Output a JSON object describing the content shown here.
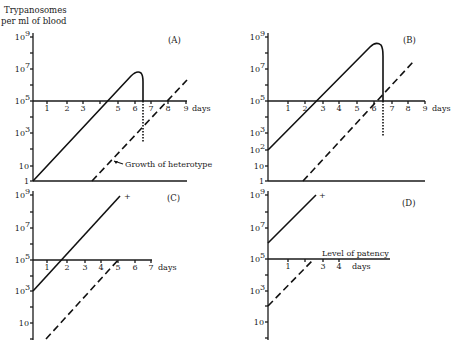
{
  "figure": {
    "ylabel_line1": "Trypanosomes",
    "ylabel_line2": "per ml of blood",
    "days_label": "days",
    "heterotype_note": "Growth of heterotype",
    "patency_note": "Level of patency",
    "colors": {
      "ink": "#111111",
      "background": "#ffffff"
    }
  },
  "chart_data": [
    {
      "type": "line",
      "panel": "(A)",
      "yscale": "log",
      "ylabel": "Trypanosomes per ml of blood",
      "xlabel": "days",
      "yticks": [
        "1",
        "10",
        "10^3",
        "10^5",
        "10^7",
        "10^9"
      ],
      "xticks": [
        1,
        2,
        3,
        4,
        5,
        6,
        7,
        8,
        9
      ],
      "ylim": [
        1,
        1000000000.0
      ],
      "xlim": [
        0,
        9
      ],
      "series": [
        {
          "name": "Infecting trypanosomes",
          "style": "solid",
          "points": [
            [
              0,
              1
            ],
            [
              5.8,
              5000000.0
            ],
            [
              6.3,
              5000000.0
            ],
            [
              6.5,
              100000.0
            ]
          ],
          "note": "falls below level of patency at ~6.5 days (dotted continuation to ~10^2.5)"
        },
        {
          "name": "Growth of heterotype",
          "style": "dashed",
          "points": [
            [
              3.5,
              1
            ],
            [
              9,
              1500000.0
            ]
          ]
        }
      ],
      "annotations": [
        "Growth of heterotype"
      ]
    },
    {
      "type": "line",
      "panel": "(B)",
      "yscale": "log",
      "xlabel": "days",
      "yticks": [
        "1",
        "10",
        "10^2",
        "10^3",
        "10^5",
        "10^7",
        "10^9"
      ],
      "xticks": [
        1,
        2,
        3,
        4,
        5,
        6,
        7,
        8,
        9
      ],
      "ylim": [
        1,
        1000000000.0
      ],
      "xlim": [
        0,
        9
      ],
      "series": [
        {
          "name": "Infecting trypanosomes",
          "style": "solid",
          "points": [
            [
              0,
              100
            ],
            [
              5.6,
              500000000.0
            ],
            [
              6.0,
              500000000.0
            ],
            [
              6.1,
              100000.0
            ]
          ],
          "note": "falls below level of patency at ~6.1 days (dotted continuation)"
        },
        {
          "name": "Heterotype",
          "style": "dashed",
          "points": [
            [
              1.9,
              1
            ],
            [
              8.3,
              20000000.0
            ]
          ]
        }
      ]
    },
    {
      "type": "line",
      "panel": "(C)",
      "yscale": "log",
      "xlabel": "days",
      "yticks": [
        "10",
        "10^3",
        "10^5",
        "10^7",
        "10^9"
      ],
      "xticks": [
        1,
        2,
        3,
        4,
        5,
        6,
        7
      ],
      "xlim": [
        0,
        7
      ],
      "series": [
        {
          "name": "Infecting trypanosomes",
          "style": "solid",
          "points": [
            [
              0,
              1000
            ],
            [
              5.2,
              1000000000.0
            ]
          ],
          "end_marker": "+ (death)"
        },
        {
          "name": "Heterotype",
          "style": "dashed",
          "points": [
            [
              0.8,
              1
            ],
            [
              5.2,
              100000.0
            ]
          ]
        }
      ]
    },
    {
      "type": "line",
      "panel": "(D)",
      "yscale": "log",
      "xlabel": "days",
      "yticks": [
        "10",
        "10^3",
        "10^5",
        "10^7",
        "10^9"
      ],
      "xticks": [
        1,
        2,
        3,
        4
      ],
      "xlim": [
        0,
        4
      ],
      "series": [
        {
          "name": "Infecting trypanosomes",
          "style": "solid",
          "points": [
            [
              0,
              1000000.0
            ],
            [
              2.6,
              1000000000.0
            ]
          ],
          "end_marker": "+ (death)"
        },
        {
          "name": "Heterotype",
          "style": "dashed",
          "points": [
            [
              0,
              100
            ],
            [
              2.5,
              100000.0
            ]
          ]
        }
      ],
      "annotations": [
        "Level of patency"
      ]
    }
  ],
  "panels": [
    {
      "id": "A",
      "label": "(A)",
      "axis_x": 33,
      "y_top": 33,
      "y_base": 181,
      "x_end": 187,
      "y_patency": 101,
      "ylabels": [
        {
          "t": "10",
          "sup": "9",
          "y": 37
        },
        {
          "t": "10",
          "sup": "7",
          "y": 69
        },
        {
          "t": "10",
          "sup": "5",
          "y": 101
        },
        {
          "t": "10",
          "sup": "3",
          "y": 133
        },
        {
          "t": "10",
          "sup": "",
          "y": 166
        },
        {
          "t": "1",
          "sup": "",
          "y": 181
        }
      ],
      "minor_ticks": [
        53,
        85,
        117,
        149
      ],
      "xticks": [
        {
          "t": "1",
          "x": 47
        },
        {
          "t": "2",
          "x": 67
        },
        {
          "t": "3",
          "x": 83
        },
        {
          "t": "",
          "x": 100
        },
        {
          "t": "5",
          "x": 118
        },
        {
          "t": "6",
          "x": 135
        },
        {
          "t": "7",
          "x": 151
        },
        {
          "t": "8",
          "x": 168
        },
        {
          "t": "9",
          "x": 186
        }
      ],
      "days_x": 192,
      "label_x": 168,
      "label_y": 43,
      "solid_path": "M33,181 L131,76 Q137,70 141,73 Q143,75 143,82 L143,101",
      "dotted_path": "M143,101 L143,143",
      "dashed_path": "M92,181 L187,80",
      "base_line": true,
      "note": {
        "x": 125,
        "y": 167,
        "arrow_from": [
          123,
          164
        ],
        "arrow_to": [
          114,
          161
        ]
      }
    },
    {
      "id": "B",
      "label": "(B)",
      "axis_x": 268,
      "y_top": 33,
      "y_base": 181,
      "x_end": 425,
      "y_patency": 101,
      "ylabels": [
        {
          "t": "10",
          "sup": "9",
          "y": 37
        },
        {
          "t": "10",
          "sup": "7",
          "y": 69
        },
        {
          "t": "10",
          "sup": "5",
          "y": 101
        },
        {
          "t": "10",
          "sup": "3",
          "y": 133
        },
        {
          "t": "10",
          "sup": "2",
          "y": 150
        },
        {
          "t": "10",
          "sup": "",
          "y": 166
        },
        {
          "t": "1",
          "sup": "",
          "y": 181
        }
      ],
      "minor_ticks": [
        53,
        85,
        117
      ],
      "xticks": [
        {
          "t": "1",
          "x": 288
        },
        {
          "t": "2",
          "x": 305
        },
        {
          "t": "3",
          "x": 323
        },
        {
          "t": "4",
          "x": 339
        },
        {
          "t": "5",
          "x": 357
        },
        {
          "t": "6",
          "x": 374
        },
        {
          "t": "7",
          "x": 392
        },
        {
          "t": "8",
          "x": 408
        },
        {
          "t": "9",
          "x": 425
        }
      ],
      "days_x": 432,
      "label_x": 403,
      "label_y": 43,
      "solid_path": "M268,150 L370,47 Q376,41 381,45 Q383,48 383,56 L383,101",
      "dotted_path": "M383,101 L383,137",
      "dashed_path": "M303,181 L413,62",
      "base_line": true
    },
    {
      "id": "C",
      "label": "(C)",
      "axis_x": 33,
      "y_top": 191,
      "y_base": 340,
      "x_end": 152,
      "y_patency": 260,
      "ylabels": [
        {
          "t": "10",
          "sup": "9",
          "y": 195
        },
        {
          "t": "10",
          "sup": "7",
          "y": 228
        },
        {
          "t": "10",
          "sup": "5",
          "y": 260
        },
        {
          "t": "10",
          "sup": "3",
          "y": 291
        },
        {
          "t": "10",
          "sup": "",
          "y": 323
        }
      ],
      "minor_ticks": [
        212,
        244,
        276,
        307,
        339
      ],
      "xticks": [
        {
          "t": "1",
          "x": 47
        },
        {
          "t": "2",
          "x": 67
        },
        {
          "t": "3",
          "x": 85
        },
        {
          "t": "4",
          "x": 101
        },
        {
          "t": "5",
          "x": 118
        },
        {
          "t": "6",
          "x": 135
        },
        {
          "t": "7",
          "x": 151
        }
      ],
      "days_x": 158,
      "label_x": 167,
      "label_y": 201,
      "solid_path": "M33,291 L120,196",
      "dashed_path": "M46,339 L119,259",
      "plus": {
        "x": 124,
        "y": 197
      },
      "base_line": false
    },
    {
      "id": "D",
      "label": "(D)",
      "axis_x": 268,
      "y_top": 191,
      "y_base": 340,
      "x_end": 390,
      "y_patency": 259,
      "ylabels": [
        {
          "t": "10",
          "sup": "9",
          "y": 195
        },
        {
          "t": "10",
          "sup": "7",
          "y": 228
        },
        {
          "t": "10",
          "sup": "5",
          "y": 259
        },
        {
          "t": "10",
          "sup": "3",
          "y": 291
        },
        {
          "t": "10",
          "sup": "",
          "y": 322
        }
      ],
      "minor_ticks": [
        212,
        275,
        306,
        338
      ],
      "xticks": [
        {
          "t": "1",
          "x": 288
        },
        {
          "t": "",
          "x": 305
        },
        {
          "t": "3",
          "x": 323
        },
        {
          "t": "4",
          "x": 339
        }
      ],
      "days_x": 352,
      "label_x": 402,
      "label_y": 206,
      "solid_path": "M268,243 L316,195",
      "dashed_path": "M268,306 L313,260",
      "plus": {
        "x": 319,
        "y": 196
      },
      "base_line": false,
      "patency_note": {
        "x": 322,
        "y": 256
      }
    }
  ]
}
